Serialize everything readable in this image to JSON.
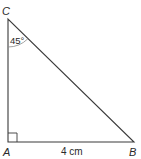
{
  "diagram": {
    "type": "right-triangle",
    "vertices": {
      "A": {
        "label": "A",
        "x": 8,
        "y": 142
      },
      "B": {
        "label": "B",
        "x": 134,
        "y": 142
      },
      "C": {
        "label": "C",
        "x": 8,
        "y": 19
      }
    },
    "angle_label": "45°",
    "angle_at": "C",
    "right_angle_at": "A",
    "side_label": "4 cm",
    "side_between": "A-B",
    "colors": {
      "stroke": "#3a3a3a",
      "text": "#2a2a2a",
      "background": "#ffffff"
    }
  }
}
